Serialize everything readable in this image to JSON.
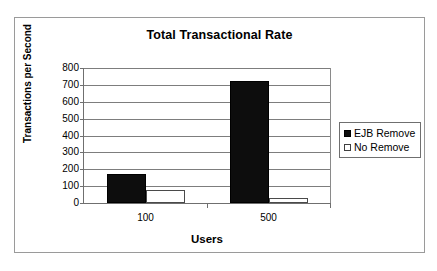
{
  "chart_data": {
    "type": "bar",
    "title": "Total Transactional Rate",
    "xlabel": "Users",
    "ylabel": "Transactions per Second",
    "categories": [
      "100",
      "500"
    ],
    "series": [
      {
        "name": "EJB Remove",
        "values": [
          170,
          725
        ],
        "style": "filled",
        "color": "#0d0d0d"
      },
      {
        "name": "No Remove",
        "values": [
          80,
          30
        ],
        "style": "open",
        "color": "#ffffff"
      }
    ],
    "ylim": [
      0,
      800
    ],
    "ytick_step": 100,
    "yticks": [
      800,
      700,
      600,
      500,
      400,
      300,
      200,
      100,
      0
    ],
    "ytick_labels": [
      "800",
      "700",
      "600",
      "500",
      "400",
      "300",
      "200",
      "100",
      "0"
    ],
    "grid": true,
    "grid_axis": "y",
    "legend_position": "right",
    "legend_entries": [
      "EJB Remove",
      "No Remove"
    ],
    "frame": true
  }
}
